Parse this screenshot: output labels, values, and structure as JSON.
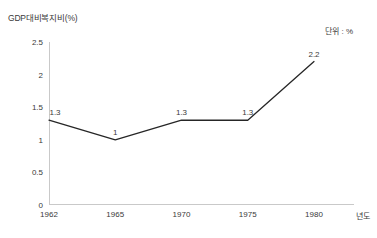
{
  "chart_data": {
    "type": "line",
    "title": "GDP대비복지비(%)",
    "unit_note": "단위 : %",
    "xlabel": "년도",
    "ylabel": "",
    "categories": [
      "1962",
      "1965",
      "1970",
      "1975",
      "1980"
    ],
    "values": [
      1.3,
      1,
      1.3,
      1.3,
      2.2
    ],
    "point_labels": [
      "1.3",
      "1",
      "1.3",
      "1.3",
      "2.2"
    ],
    "ylim": [
      0,
      2.5
    ],
    "y_ticks": [
      0,
      0.5,
      1,
      1.5,
      2,
      2.5
    ],
    "y_tick_labels": [
      "0",
      "0.5",
      "1",
      "1.5",
      "2",
      "2.5"
    ],
    "grid": false,
    "legend": "none",
    "line_color": "#262626",
    "axis_color": "#c9c9c9",
    "text_color": "#3a3a3a"
  }
}
